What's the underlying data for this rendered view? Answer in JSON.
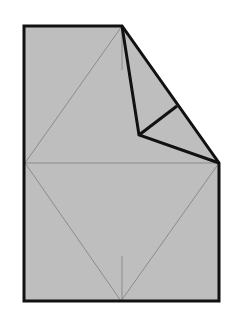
{
  "diagram": {
    "type": "origami-fold-step",
    "colors": {
      "paper": "#bebebe",
      "outline": "#111111",
      "crease": "#808080",
      "background": "#ffffff"
    },
    "points": {
      "top_left": [
        24,
        26
      ],
      "top_fold": [
        122,
        26
      ],
      "right_corner": [
        219,
        163
      ],
      "bottom_right": [
        219,
        301
      ],
      "bottom_mid": [
        121,
        301
      ],
      "bottom_left": [
        24,
        301
      ],
      "left_mid": [
        25,
        163
      ],
      "inner_vertex": [
        139,
        135
      ],
      "edge_mid": [
        177,
        106
      ]
    }
  }
}
